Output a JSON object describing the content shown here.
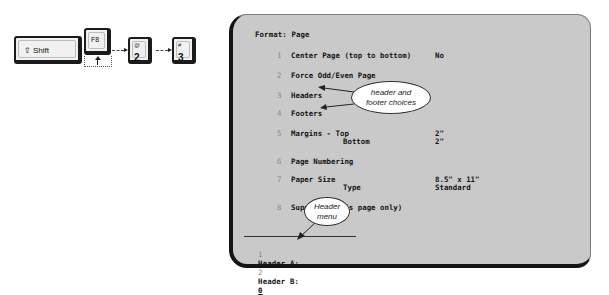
{
  "keystrokes": {
    "keys": [
      {
        "id": "shift",
        "label": "Shift",
        "icon": "shift-arrow-icon"
      },
      {
        "id": "f8",
        "label": "F8"
      },
      {
        "id": "two",
        "top": "@",
        "bottom": "2"
      },
      {
        "id": "three",
        "top": "#",
        "bottom": "3"
      }
    ]
  },
  "screen": {
    "title": "Format: Page",
    "items": [
      {
        "num": "1",
        "label": "Center Page (top to bottom)",
        "value": "No"
      },
      {
        "num": "2",
        "label": "Force Odd/Even Page",
        "value": ""
      },
      {
        "num": "3",
        "label": "Headers",
        "value": ""
      },
      {
        "num": "4",
        "label": "Footers",
        "value": ""
      },
      {
        "num": "5",
        "label": "Margins - Top",
        "value": "2\"",
        "sub_label": "Bottom",
        "sub_value": "2\""
      },
      {
        "num": "6",
        "label": "Page Numbering",
        "value": ""
      },
      {
        "num": "7",
        "label": "Paper Size",
        "value": "8.5\" x 11\"",
        "sub_label": "Type",
        "sub_value": "Standard"
      },
      {
        "num": "8",
        "label": "Suppress (this page only)",
        "value": ""
      }
    ],
    "status_bar": {
      "opt1_num": "1",
      "opt1_label": "Header A;",
      "opt2_num": "2",
      "opt2_label": "Header B:",
      "current_value": "0"
    }
  },
  "callouts": {
    "header_footer": {
      "line1": "header and",
      "line2": "footer choices"
    },
    "header_menu": {
      "line1": "Header",
      "line2": "menu"
    }
  }
}
